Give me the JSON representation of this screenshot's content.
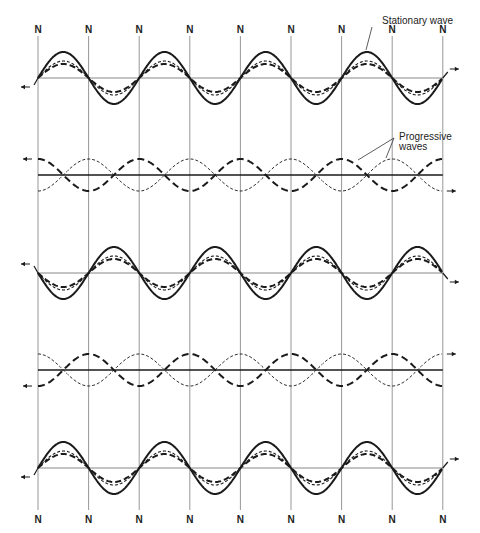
{
  "diagram": {
    "node_label": "N",
    "node_count": 9,
    "annotations": {
      "stationary": "Stationary wave",
      "progressive_line1": "Progressive",
      "progressive_line2": "waves"
    },
    "rows": [
      {
        "type": "stationary",
        "phase": 1,
        "label": "Stationary wave snapshot 1"
      },
      {
        "type": "progressive",
        "phase": 1,
        "label": "Progressive waves snapshot 1"
      },
      {
        "type": "stationary",
        "phase": -1,
        "label": "Stationary wave snapshot 2"
      },
      {
        "type": "progressive",
        "phase": -1,
        "label": "Progressive waves snapshot 2"
      },
      {
        "type": "stationary",
        "phase": 1,
        "label": "Stationary wave snapshot 3"
      }
    ],
    "colors": {
      "ink": "#1a1a1a",
      "grid": "#6a6a6a",
      "background": "#ffffff"
    }
  }
}
